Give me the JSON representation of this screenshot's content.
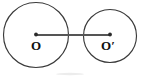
{
  "figure": {
    "type": "geometry-diagram",
    "background_color": "#ffffff",
    "stroke_color": "#3a3a3a",
    "line_color": "#555555",
    "label_color": "#111111",
    "elements": {
      "left_circle": {
        "name": "circle-o",
        "center_x": 36,
        "center_y": 35,
        "radius": 32.5,
        "center_label": "O"
      },
      "right_circle": {
        "name": "circle-o-prime",
        "center_x": 110,
        "center_y": 36,
        "radius": 26.5,
        "center_label": "O",
        "center_label_prime": "′"
      },
      "segment": {
        "name": "center-to-center-segment",
        "x1": 36,
        "y1": 35,
        "x2": 110,
        "y2": 35,
        "label": ""
      }
    },
    "labels": {
      "left_center": "O",
      "right_center": "O′"
    }
  }
}
